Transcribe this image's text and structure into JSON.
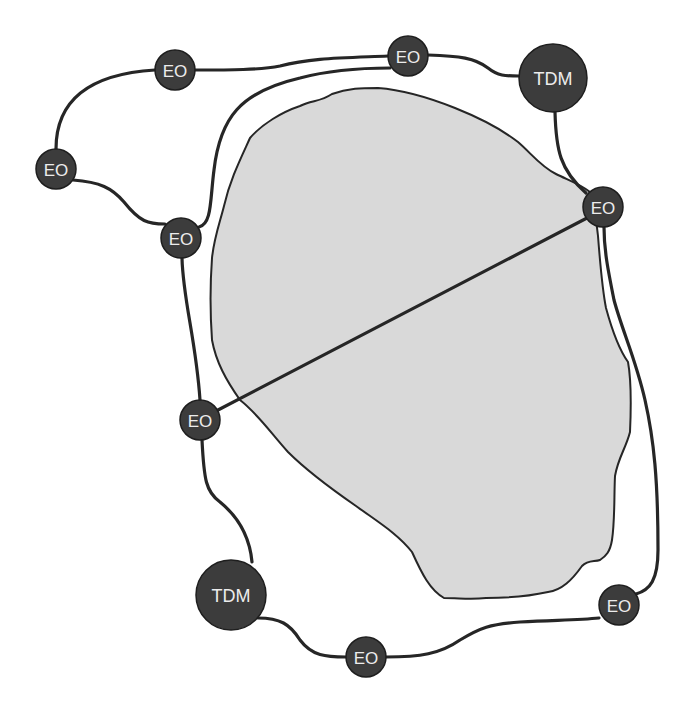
{
  "diagram": {
    "colors": {
      "background": "#ffffff",
      "region_fill": "#d9d9d9",
      "region_stroke": "#262626",
      "link": "#262626",
      "node_fill": "#3c3c3c",
      "node_label": "#ececec"
    },
    "region": {
      "label": "",
      "path": "M250,138 C262,124 282,112 300,106 C312,100 320,102 332,94 C348,88 362,88 378,88 C405,90 430,98 455,108 C480,118 500,128 518,142 C532,154 540,166 556,174 C568,180 580,184 590,192 C595,206 596,220 598,236 C600,262 602,288 606,308 C612,330 618,348 628,362 C632,384 631,410 630,432 C626,448 618,458 615,476 C614,496 615,520 612,540 C610,552 606,556 600,560 C594,562 588,560 582,566 C572,580 562,590 548,592 C530,596 506,598 486,598 C470,600 460,598 444,598 C430,590 422,574 412,552 C398,534 378,522 356,506 C330,488 306,470 288,452 C270,432 258,414 240,400 C226,380 216,362 212,340 C210,312 210,286 212,258 C214,238 220,222 224,206 C230,180 240,160 250,138 Z"
    },
    "nodes": [
      {
        "id": "eo-top-left",
        "label": "EO",
        "type": "EO",
        "x": 175,
        "y": 70,
        "r": 20
      },
      {
        "id": "eo-top-middle",
        "label": "EO",
        "type": "EO",
        "x": 408,
        "y": 56,
        "r": 20
      },
      {
        "id": "tdm-top-right",
        "label": "TDM",
        "type": "TDM",
        "x": 553,
        "y": 78,
        "r": 34
      },
      {
        "id": "eo-far-left",
        "label": "EO",
        "type": "EO",
        "x": 56,
        "y": 169,
        "r": 20
      },
      {
        "id": "eo-inner-left",
        "label": "EO",
        "type": "EO",
        "x": 181,
        "y": 238,
        "r": 20
      },
      {
        "id": "eo-right",
        "label": "EO",
        "type": "EO",
        "x": 603,
        "y": 207,
        "r": 20
      },
      {
        "id": "eo-left-middle",
        "label": "EO",
        "type": "EO",
        "x": 200,
        "y": 420,
        "r": 20
      },
      {
        "id": "tdm-bottom-left",
        "label": "TDM",
        "type": "TDM",
        "x": 231,
        "y": 595,
        "r": 35
      },
      {
        "id": "eo-bottom",
        "label": "EO",
        "type": "EO",
        "x": 366,
        "y": 657,
        "r": 20
      },
      {
        "id": "eo-bottom-right",
        "label": "EO",
        "type": "EO",
        "x": 619,
        "y": 605,
        "r": 20
      }
    ],
    "links": [
      {
        "from": "eo-far-left",
        "to": "eo-top-left",
        "path": "M56,149 C56,100 90,74 155,70"
      },
      {
        "from": "eo-top-left",
        "to": "eo-top-middle",
        "path": "M195,70 C230,70 260,70 280,66 C310,58 340,58 388,56"
      },
      {
        "from": "eo-top-middle",
        "to": "tdm-top-right",
        "path": "M428,55 C460,56 475,58 488,68 C498,76 505,76 519,76"
      },
      {
        "from": "tdm-top-right",
        "to": "eo-right",
        "path": "M555,112 C556,150 560,170 586,193"
      },
      {
        "from": "eo-far-left",
        "to": "eo-inner-left",
        "path": "M73,180 C100,182 112,188 124,202 C140,222 148,224 165,224"
      },
      {
        "from": "eo-inner-left",
        "to": "eo-top-middle",
        "path": "M199,227 C212,224 210,200 214,170 C220,118 240,92 300,78 C330,70 360,68 390,68"
      },
      {
        "from": "eo-inner-left",
        "to": "eo-left-middle",
        "path": "M182,258 C183,300 196,340 200,400"
      },
      {
        "from": "eo-right",
        "to": "eo-left-middle",
        "path": "M587,218 L218,410"
      },
      {
        "from": "eo-left-middle",
        "to": "tdm-bottom-left",
        "path": "M202,440 C204,480 206,492 220,502 C242,520 250,540 252,562"
      },
      {
        "from": "tdm-bottom-left",
        "to": "eo-bottom",
        "path": "M258,618 C280,618 290,624 300,640 C312,656 326,657 346,657"
      },
      {
        "from": "eo-bottom",
        "to": "eo-bottom-right",
        "path": "M386,657 C420,657 440,654 460,640 C480,628 490,624 520,622 C560,620 580,620 599,618"
      },
      {
        "from": "eo-bottom-right",
        "to": "eo-right",
        "path": "M636,594 C650,590 658,580 658,550 C658,480 654,440 645,400 C636,360 622,330 614,300 C608,270 604,250 604,227"
      }
    ]
  }
}
